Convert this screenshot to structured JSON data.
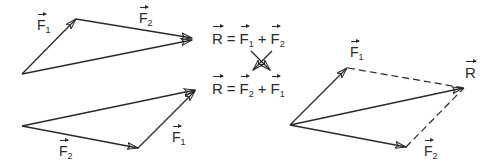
{
  "diagram": {
    "colors": {
      "stroke": "#2a2a2a",
      "background": "#ffffff"
    },
    "labels": {
      "F": "F",
      "R": "R",
      "sub1": "1",
      "sub2": "2"
    },
    "equations": [
      {
        "lhs": "R",
        "eq": "=",
        "a": "F",
        "a_sub": "1",
        "op": "+",
        "b": "F",
        "b_sub": "2"
      },
      {
        "lhs": "R",
        "eq": "=",
        "a": "F",
        "a_sub": "2",
        "op": "+",
        "b": "F",
        "b_sub": "1"
      }
    ],
    "panels": [
      {
        "name": "triangle-F1-then-F2",
        "vectors": [
          "F1",
          "F2",
          "R"
        ]
      },
      {
        "name": "triangle-F2-then-F1",
        "vectors": [
          "F2",
          "F1",
          "R"
        ]
      },
      {
        "name": "parallelogram",
        "vectors": [
          "F1",
          "F2",
          "R"
        ],
        "dashed_sides": 2
      }
    ]
  }
}
